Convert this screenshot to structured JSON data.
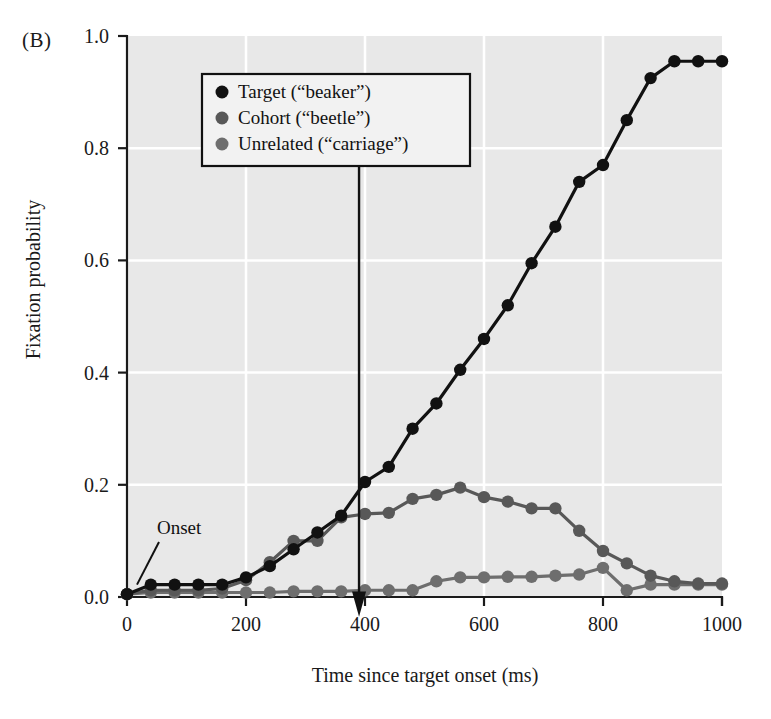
{
  "figure": {
    "panel_label": "(B)",
    "xlabel": "Time since target onset (ms)",
    "ylabel": "Fixation probability"
  },
  "legend": {
    "items": [
      {
        "label": "Target (“beaker”)",
        "color": "#111111"
      },
      {
        "label": "Cohort (“beetle”)",
        "color": "#585858"
      },
      {
        "label": "Unrelated (“carriage”)",
        "color": "#6e6e6e"
      }
    ]
  },
  "annotations": {
    "onset": {
      "text": "Onset",
      "x": 0,
      "y": 0.0
    },
    "target_offset": {
      "line1": "Average",
      "line2": "target offset",
      "x": 390
    }
  },
  "axes": {
    "x_ticks": [
      "0",
      "200",
      "400",
      "600",
      "800",
      "1000"
    ],
    "y_ticks": [
      "0.0",
      "0.2",
      "0.4",
      "0.6",
      "0.8",
      "1.0"
    ],
    "plot_bg": "#e8e8e8",
    "grid_color": "#ffffff"
  },
  "chart_data": {
    "type": "line",
    "title": "",
    "xlabel": "Time since target onset (ms)",
    "ylabel": "Fixation probability",
    "xlim": [
      0,
      1000
    ],
    "ylim": [
      0.0,
      1.0
    ],
    "grid": true,
    "legend_position": "upper-left",
    "x": [
      0,
      40,
      80,
      120,
      160,
      200,
      240,
      280,
      320,
      360,
      400,
      440,
      480,
      520,
      560,
      600,
      640,
      680,
      720,
      760,
      800,
      840,
      880,
      920,
      960,
      1000
    ],
    "series": [
      {
        "name": "Target (“beaker”)",
        "color": "#111111",
        "values": [
          0.005,
          0.022,
          0.022,
          0.022,
          0.022,
          0.035,
          0.055,
          0.085,
          0.115,
          0.145,
          0.205,
          0.232,
          0.3,
          0.345,
          0.405,
          0.46,
          0.52,
          0.595,
          0.66,
          0.74,
          0.77,
          0.85,
          0.925,
          0.955,
          0.955,
          0.955
        ]
      },
      {
        "name": "Cohort (“beetle”)",
        "color": "#585858",
        "values": [
          0.005,
          0.012,
          0.012,
          0.012,
          0.015,
          0.03,
          0.062,
          0.1,
          0.1,
          0.142,
          0.148,
          0.15,
          0.175,
          0.182,
          0.195,
          0.178,
          0.17,
          0.158,
          0.158,
          0.118,
          0.082,
          0.06,
          0.038,
          0.028,
          0.024,
          0.024
        ]
      },
      {
        "name": "Unrelated (“carriage”)",
        "color": "#6e6e6e",
        "values": [
          0.005,
          0.008,
          0.008,
          0.008,
          0.008,
          0.008,
          0.008,
          0.01,
          0.01,
          0.01,
          0.012,
          0.012,
          0.012,
          0.028,
          0.035,
          0.035,
          0.036,
          0.036,
          0.038,
          0.04,
          0.052,
          0.012,
          0.022,
          0.022,
          0.022,
          0.022
        ]
      }
    ],
    "vertical_marker": {
      "label": "Average target offset",
      "x": 390
    }
  }
}
